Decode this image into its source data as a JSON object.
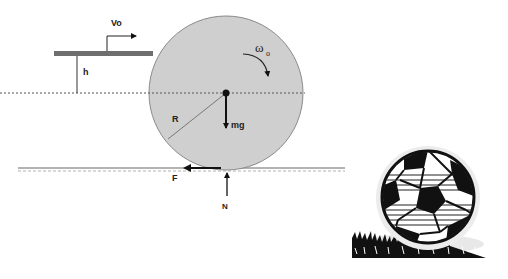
{
  "diagram": {
    "labels": {
      "velocity": "Vo",
      "height": "h",
      "angular_velocity": "ω",
      "angular_velocity_sub": "o",
      "radius": "R",
      "weight": "mg",
      "friction": "F",
      "normal": "N"
    },
    "colors": {
      "ball_fill": "#cfcfcf",
      "ball_stroke": "#8a8a8a",
      "bar": "#6e6e6e",
      "ground": "#9a9a9a",
      "arrow": "#111111"
    }
  }
}
